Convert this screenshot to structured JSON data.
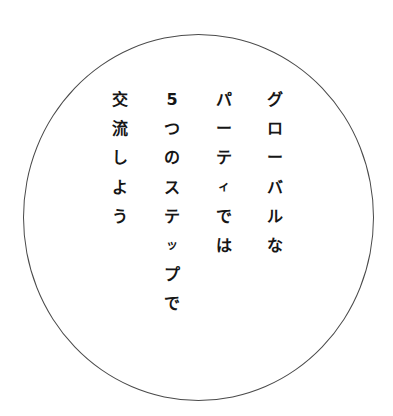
{
  "text": {
    "full": "グローバルなパーティでは5つのステップで交流しよう",
    "columns": [
      {
        "chars": [
          "グ",
          "ロ",
          "ー",
          "バ",
          "ル",
          "な"
        ]
      },
      {
        "chars": [
          "パ",
          "ー",
          "テ",
          "ィ",
          "で",
          "は"
        ]
      },
      {
        "chars": [
          "5",
          "つ",
          "の",
          "ス",
          "テ",
          "ッ",
          "プ",
          "で"
        ]
      },
      {
        "chars": [
          "交",
          "流",
          "し",
          "よ",
          "う"
        ]
      }
    ]
  },
  "colors": {
    "text": "#161616",
    "circle_stroke": "#4a4a4a",
    "background": "#ffffff"
  }
}
